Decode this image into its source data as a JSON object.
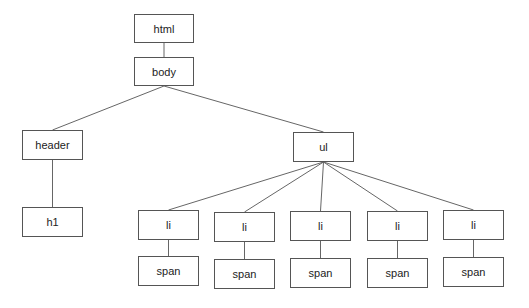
{
  "diagram": {
    "type": "dom-tree",
    "line_color": "#666666",
    "border_color": "#555555",
    "nodes": [
      {
        "id": "html",
        "label": "html",
        "x": 134,
        "y": 14,
        "w": 60,
        "h": 29
      },
      {
        "id": "body",
        "label": "body",
        "x": 134,
        "y": 57,
        "w": 60,
        "h": 29
      },
      {
        "id": "header",
        "label": "header",
        "x": 22,
        "y": 130,
        "w": 61,
        "h": 30
      },
      {
        "id": "h1",
        "label": "h1",
        "x": 22,
        "y": 207,
        "w": 61,
        "h": 30
      },
      {
        "id": "ul",
        "label": "ul",
        "x": 293,
        "y": 132,
        "w": 61,
        "h": 30
      },
      {
        "id": "li1",
        "label": "li",
        "x": 138,
        "y": 210,
        "w": 61,
        "h": 30
      },
      {
        "id": "li2",
        "label": "li",
        "x": 214,
        "y": 212,
        "w": 61,
        "h": 30
      },
      {
        "id": "li3",
        "label": "li",
        "x": 290,
        "y": 211,
        "w": 61,
        "h": 30
      },
      {
        "id": "li4",
        "label": "li",
        "x": 367,
        "y": 211,
        "w": 61,
        "h": 30
      },
      {
        "id": "li5",
        "label": "li",
        "x": 443,
        "y": 210,
        "w": 61,
        "h": 30
      },
      {
        "id": "span1",
        "label": "span",
        "x": 138,
        "y": 256,
        "w": 61,
        "h": 30
      },
      {
        "id": "span2",
        "label": "span",
        "x": 214,
        "y": 259,
        "w": 61,
        "h": 30
      },
      {
        "id": "span3",
        "label": "span",
        "x": 290,
        "y": 258,
        "w": 61,
        "h": 30
      },
      {
        "id": "span4",
        "label": "span",
        "x": 367,
        "y": 258,
        "w": 61,
        "h": 30
      },
      {
        "id": "span5",
        "label": "span",
        "x": 443,
        "y": 257,
        "w": 61,
        "h": 30
      }
    ],
    "edges": [
      [
        "html",
        "body"
      ],
      [
        "body",
        "header"
      ],
      [
        "body",
        "ul"
      ],
      [
        "header",
        "h1"
      ],
      [
        "ul",
        "li1"
      ],
      [
        "ul",
        "li2"
      ],
      [
        "ul",
        "li3"
      ],
      [
        "ul",
        "li4"
      ],
      [
        "ul",
        "li5"
      ],
      [
        "li1",
        "span1"
      ],
      [
        "li2",
        "span2"
      ],
      [
        "li3",
        "span3"
      ],
      [
        "li4",
        "span4"
      ],
      [
        "li5",
        "span5"
      ]
    ]
  }
}
